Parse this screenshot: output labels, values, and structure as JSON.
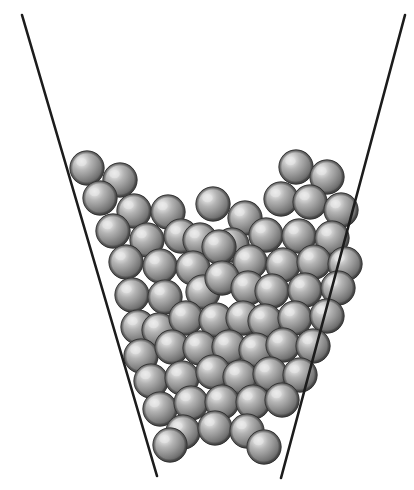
{
  "figure": {
    "canvas": {
      "width": 414,
      "height": 490,
      "background": "#ffffff"
    },
    "sphere_style": {
      "radius": 17.2,
      "fill_light": "#e8e8e8",
      "fill_mid": "#9a9a9a",
      "fill_dark": "#4e4e4e",
      "outline": "#3a3a3a",
      "highlight_offset_x": -0.32,
      "highlight_offset_y": -0.34
    },
    "walls": {
      "label": "hopper-wall",
      "color": "#1c1c1c",
      "stroke_width": 2.6,
      "left": {
        "x1": 22,
        "y1": 15,
        "x2": 157,
        "y2": 476
      },
      "right": {
        "x1": 405,
        "y1": 15,
        "x2": 281,
        "y2": 478
      }
    },
    "spheres": [
      {
        "cx": 87,
        "cy": 168
      },
      {
        "cx": 120,
        "cy": 180
      },
      {
        "cx": 100,
        "cy": 198
      },
      {
        "cx": 134,
        "cy": 211
      },
      {
        "cx": 168,
        "cy": 212
      },
      {
        "cx": 213,
        "cy": 204
      },
      {
        "cx": 245,
        "cy": 218
      },
      {
        "cx": 281,
        "cy": 199
      },
      {
        "cx": 296,
        "cy": 167
      },
      {
        "cx": 327,
        "cy": 177
      },
      {
        "cx": 310,
        "cy": 202
      },
      {
        "cx": 341,
        "cy": 210
      },
      {
        "cx": 113,
        "cy": 231
      },
      {
        "cx": 147,
        "cy": 240
      },
      {
        "cx": 181,
        "cy": 236
      },
      {
        "cx": 200,
        "cy": 240
      },
      {
        "cx": 232,
        "cy": 245
      },
      {
        "cx": 266,
        "cy": 235
      },
      {
        "cx": 299,
        "cy": 236
      },
      {
        "cx": 332,
        "cy": 238
      },
      {
        "cx": 126,
        "cy": 262
      },
      {
        "cx": 160,
        "cy": 266
      },
      {
        "cx": 193,
        "cy": 268
      },
      {
        "cx": 219,
        "cy": 247
      },
      {
        "cx": 250,
        "cy": 262
      },
      {
        "cx": 283,
        "cy": 265
      },
      {
        "cx": 314,
        "cy": 262
      },
      {
        "cx": 345,
        "cy": 264
      },
      {
        "cx": 132,
        "cy": 295
      },
      {
        "cx": 165,
        "cy": 297
      },
      {
        "cx": 203,
        "cy": 292
      },
      {
        "cx": 222,
        "cy": 278
      },
      {
        "cx": 248,
        "cy": 288
      },
      {
        "cx": 272,
        "cy": 291
      },
      {
        "cx": 305,
        "cy": 290
      },
      {
        "cx": 338,
        "cy": 288
      },
      {
        "cx": 138,
        "cy": 327
      },
      {
        "cx": 159,
        "cy": 330
      },
      {
        "cx": 186,
        "cy": 318
      },
      {
        "cx": 216,
        "cy": 320
      },
      {
        "cx": 243,
        "cy": 318
      },
      {
        "cx": 265,
        "cy": 321
      },
      {
        "cx": 295,
        "cy": 318
      },
      {
        "cx": 327,
        "cy": 316
      },
      {
        "cx": 141,
        "cy": 356
      },
      {
        "cx": 172,
        "cy": 347
      },
      {
        "cx": 200,
        "cy": 348
      },
      {
        "cx": 229,
        "cy": 347
      },
      {
        "cx": 256,
        "cy": 350
      },
      {
        "cx": 283,
        "cy": 345
      },
      {
        "cx": 313,
        "cy": 346
      },
      {
        "cx": 151,
        "cy": 381
      },
      {
        "cx": 182,
        "cy": 378
      },
      {
        "cx": 213,
        "cy": 372
      },
      {
        "cx": 240,
        "cy": 377
      },
      {
        "cx": 270,
        "cy": 374
      },
      {
        "cx": 300,
        "cy": 375
      },
      {
        "cx": 160,
        "cy": 409
      },
      {
        "cx": 191,
        "cy": 403
      },
      {
        "cx": 222,
        "cy": 402
      },
      {
        "cx": 253,
        "cy": 402
      },
      {
        "cx": 282,
        "cy": 400
      },
      {
        "cx": 183,
        "cy": 432
      },
      {
        "cx": 215,
        "cy": 428
      },
      {
        "cx": 247,
        "cy": 431
      },
      {
        "cx": 170,
        "cy": 445
      },
      {
        "cx": 264,
        "cy": 447
      }
    ]
  }
}
